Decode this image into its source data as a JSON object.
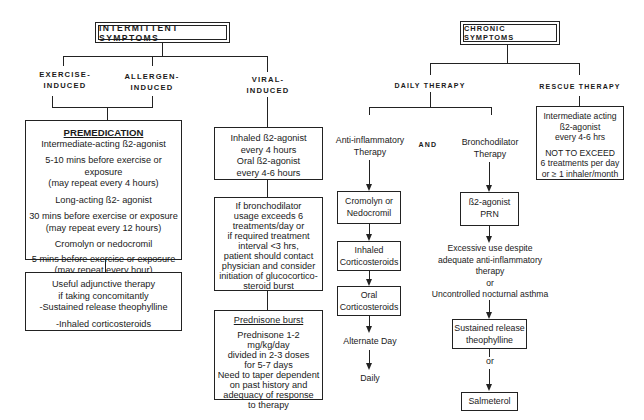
{
  "intermittent": {
    "title": "INTERMITTENT SYMPTOMS",
    "branches": {
      "exercise": [
        "EXERCISE-",
        "INDUCED"
      ],
      "allergen": [
        "ALLERGEN-",
        "INDUCED"
      ],
      "viral": [
        "VIRAL-",
        "INDUCED"
      ]
    },
    "premedication": {
      "heading": "PREMEDICATION",
      "lines": [
        "Intermediate-acting ß2-agonist",
        "5-10 mins before exercise or exposure",
        "(may repeat every 4 hours)",
        "Long-acting ß2- agonist",
        "30 mins before exercise or exposure",
        "(may repeat every 12 hours)",
        "Cromolyn or nedocromil",
        "5 mins before exercise or exposure",
        "(may repeat every hour)"
      ]
    },
    "adjunctive": {
      "lines": [
        "Useful adjunctive therapy",
        "if taking concomitantly",
        "-Sustained release theophylline",
        "-Inhaled corticosteroids"
      ]
    },
    "viral_box1": {
      "lines": [
        "Inhaled ß2-agonist",
        "every 4 hours",
        "Oral ß2-agonist",
        "every 4-6 hours"
      ]
    },
    "viral_box2": {
      "lines": [
        "If bronchodilator",
        "usage exceeds 6",
        "treatments/day or",
        "if required treatment",
        "interval <3 hrs,",
        "patient should contact",
        "physician and consider",
        "initiation of glucocortico-",
        "steroid burst"
      ]
    },
    "prednisone": {
      "heading": "Prednisone burst",
      "lines": [
        "Prednisone 1-2 mg/kg/day",
        "divided in 2-3 doses",
        "for 5-7 days",
        "Need to taper dependent",
        "on past history and",
        "adequacy of response",
        "to therapy"
      ]
    }
  },
  "chronic": {
    "title": "CHRONIC SYMPTOMS",
    "daily_label": "DAILY THERAPY",
    "rescue_label": "RESCUE THERAPY",
    "anti_inflammatory": [
      "Anti-inflammatory",
      "Therapy"
    ],
    "and_label": "AND",
    "bronchodilator": [
      "Bronchodilator",
      "Therapy"
    ],
    "cromolyn": [
      "Cromolyn or",
      "Nedocromil"
    ],
    "inhaled_cs": [
      "Inhaled",
      "Corticosteroids"
    ],
    "oral_cs": [
      "Oral",
      "Corticosteroids"
    ],
    "alternate_day": "Alternate Day",
    "daily": "Daily",
    "b2_prn": [
      "ß2-agonist",
      "PRN"
    ],
    "excessive": [
      "Excessive use despite",
      "adequate anti-inflammatory",
      "therapy",
      "or",
      "Uncontrolled nocturnal asthma"
    ],
    "theophylline": [
      "Sustained release",
      "theophylline"
    ],
    "or_label": "or",
    "salmeterol": "Salmeterol",
    "rescue_box": {
      "lines": [
        "Intermediate acting",
        "ß2-agonist",
        "every 4-6 hrs",
        "NOT TO EXCEED",
        "6 treatments per day",
        "or ≥ 1 inhaler/month"
      ]
    }
  }
}
